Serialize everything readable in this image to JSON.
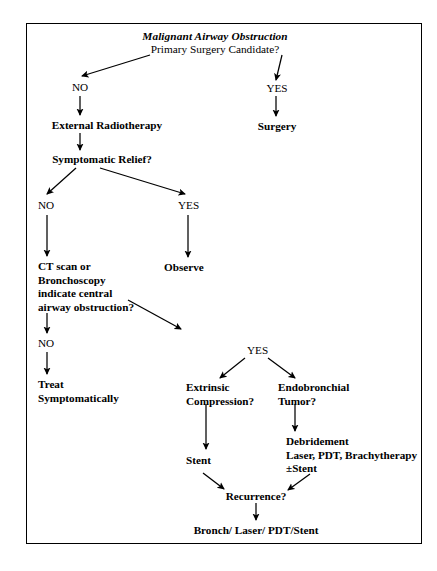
{
  "diagram": {
    "title": "Malignant Airway Obstruction",
    "subtitle": "Primary Surgery Candidate?",
    "nodes": {
      "root_title": "Malignant Airway Obstruction",
      "root_question": "Primary Surgery Candidate?",
      "no_1": "NO",
      "yes_1": "YES",
      "external_radiotherapy": "External Radiotherapy",
      "surgery": "Surgery",
      "symptomatic_relief": "Symptomatic Relief?",
      "no_2": "NO",
      "yes_2": "YES",
      "ct_bronchoscopy": "CT scan or\nBronchoscopy\nindicate central\nairway obstruction?",
      "observe": "Observe",
      "no_3": "NO",
      "treat_symptomatically": "Treat\nSymptomatically",
      "yes_3": "YES",
      "extrinsic_compression": "Extrinsic\nCompression?",
      "endobronchial_tumor": "Endobronchial\nTumor?",
      "stent": "Stent",
      "debridement": "Debridement\nLaser, PDT, Brachytherapy\n±Stent",
      "recurrence": "Recurrence?",
      "final": "Bronch/ Laser/ PDT/Stent"
    },
    "colors": {
      "ink": "#000000",
      "background": "#ffffff",
      "border": "#000000"
    }
  }
}
